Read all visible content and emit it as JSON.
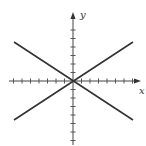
{
  "chart_data": {
    "type": "line",
    "title": "",
    "xlabel": "x",
    "ylabel": "y",
    "xlim": [
      -7.5,
      7.5
    ],
    "ylim": [
      -7.5,
      7.5
    ],
    "grid": false,
    "x_ticks": [
      -7,
      -6,
      -5,
      -4,
      -3,
      -2,
      -1,
      1,
      2,
      3,
      4,
      5,
      6,
      7
    ],
    "y_ticks": [
      -7,
      -6,
      -5,
      -4,
      -3,
      -2,
      -1,
      1,
      2,
      3,
      4,
      5,
      6
    ],
    "tick_labels_shown": false,
    "series": [
      {
        "name": "y = 2x/3",
        "x": [
          -7,
          7
        ],
        "y": [
          -4.6,
          4.6
        ]
      },
      {
        "name": "y = -2x/3",
        "x": [
          -7,
          7
        ],
        "y": [
          4.6,
          -4.6
        ]
      }
    ],
    "line_color": "#333333"
  },
  "labels": {
    "x_axis": "x",
    "y_axis": "y"
  }
}
